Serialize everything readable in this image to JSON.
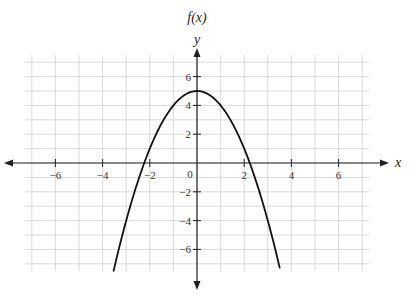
{
  "chart_data": {
    "type": "line",
    "title": "f(x)",
    "xlabel": "x",
    "ylabel": "y",
    "function": "f(x) = -x^2 + 5",
    "xlim": [
      -7.5,
      7.5
    ],
    "ylim": [
      -7.5,
      7.5
    ],
    "grid": true,
    "x_ticks": [
      -6,
      -4,
      -2,
      2,
      4,
      6
    ],
    "y_ticks": [
      -6,
      -4,
      -2,
      2,
      4,
      6
    ],
    "origin_label": "0",
    "series": [
      {
        "name": "f(x)",
        "x": [
          -3.54,
          -3,
          -2.5,
          -2.24,
          -2,
          -1.5,
          -1,
          -0.5,
          0,
          0.5,
          1,
          1.5,
          2,
          2.24,
          2.5,
          3,
          3.54
        ],
        "y": [
          -7.5,
          -4,
          -1.25,
          0,
          1,
          2.75,
          4,
          4.75,
          5,
          4.75,
          4,
          2.75,
          1,
          0,
          -1.25,
          -4,
          -7.5
        ]
      }
    ],
    "vertex": [
      0,
      5
    ],
    "roots": [
      -2.24,
      2.24
    ],
    "colors": {
      "curve": "#111111",
      "axes": "#222222",
      "grid": "#d0d0d0"
    }
  },
  "labels": {
    "title": "f(x)",
    "y_axis": "y",
    "x_axis": "x",
    "origin": "0",
    "x_tick_labels": [
      "-6",
      "-4",
      "-2",
      "2",
      "4",
      "6"
    ],
    "y_tick_labels": [
      "6",
      "4",
      "2",
      "-2",
      "-4",
      "-6"
    ]
  }
}
